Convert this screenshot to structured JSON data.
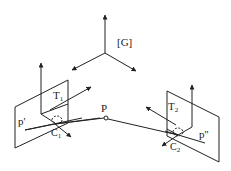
{
  "diagram": {
    "global_frame_label": "[G]",
    "point_label": "P",
    "camera1": {
      "frame_label": "T",
      "frame_sub": "1",
      "center_label": "C",
      "center_sub": "1",
      "image_point_label": "p'"
    },
    "camera2": {
      "frame_label": "T",
      "frame_sub": "2",
      "center_label": "C",
      "center_sub": "2",
      "image_point_label": "p''"
    },
    "colors": {
      "stroke": "#222222",
      "background": "#ffffff"
    }
  }
}
